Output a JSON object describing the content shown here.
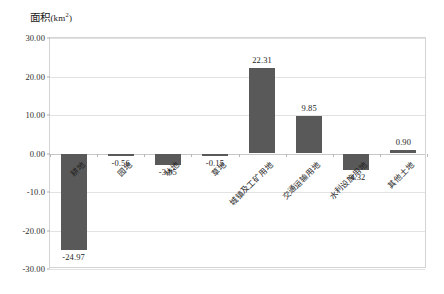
{
  "chart_data": {
    "type": "bar",
    "title": "",
    "ylabel": "面积(km²)",
    "xlabel": "",
    "categories": [
      "耕地",
      "园地",
      "林地",
      "草地",
      "城镇及工矿用地",
      "交通运输用地",
      "水利设施用地",
      "其他土地"
    ],
    "values": [
      -24.97,
      -0.56,
      -3.05,
      -0.15,
      22.31,
      9.85,
      -4.32,
      0.9
    ],
    "value_labels": [
      "-24.97",
      "-0.56",
      "-3.05",
      "-0.15",
      "22.31",
      "9.85",
      "-4.32",
      "0.90"
    ],
    "ylim": [
      -30,
      30
    ],
    "ytick_values": [
      30,
      20,
      10,
      0,
      -10,
      -20,
      -30
    ],
    "ytick_labels": [
      "30.00",
      "20.00",
      "10.00",
      "0.00",
      "-10.0",
      "-20.00",
      "-30.00"
    ],
    "grid": true,
    "legend": "none",
    "series_color": "#595959",
    "gridline_color": "#e2e2e2",
    "axis_color": "#d4d4d4",
    "background": "#ffffff"
  }
}
